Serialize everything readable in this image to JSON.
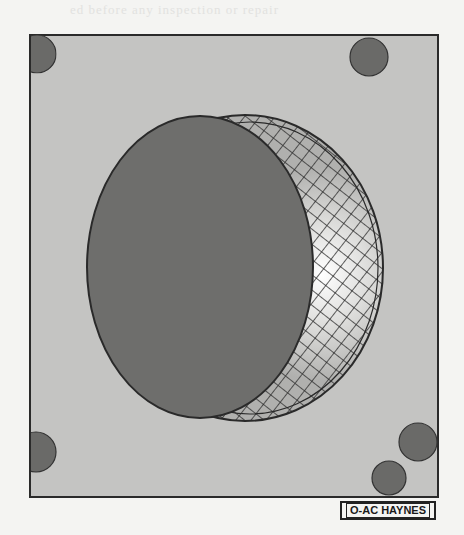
{
  "figure": {
    "caption_code": "O-AC HAYNES",
    "top_bleed_text": "ed before any inspection or repair",
    "colors": {
      "page": "#f4f4f2",
      "panel": "#c4c4c2",
      "frame": "#2a2a2a",
      "disc": "#6e6e6c",
      "dot": "#6a6a68",
      "mesh": "#2b2b2b",
      "highlight": "#f2f2f0"
    },
    "elements": [
      {
        "name": "panel-frame",
        "shape": "rect"
      },
      {
        "name": "dot-top-left",
        "shape": "circle"
      },
      {
        "name": "dot-top-right",
        "shape": "circle"
      },
      {
        "name": "dot-bottom-left",
        "shape": "circle"
      },
      {
        "name": "dot-bottom-right-upper",
        "shape": "circle"
      },
      {
        "name": "dot-bottom-right-lower",
        "shape": "circle"
      },
      {
        "name": "mesh-crescent",
        "shape": "crescent"
      },
      {
        "name": "solid-disc",
        "shape": "ellipse"
      }
    ]
  }
}
